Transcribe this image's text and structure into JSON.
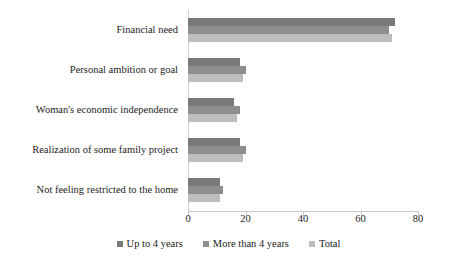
{
  "chart_data": {
    "type": "bar",
    "orientation": "horizontal",
    "title": "",
    "xlabel": "",
    "ylabel": "",
    "xlim": [
      0,
      80
    ],
    "xticks": [
      0,
      20,
      40,
      60,
      80
    ],
    "grid": false,
    "legend_position": "bottom",
    "categories": [
      "Financial need",
      "Personal ambition or goal",
      "Woman's economic independence",
      "Realization of some family project",
      "Not feeling restricted to the home"
    ],
    "series": [
      {
        "name": "Up to 4 years",
        "color": "#7a7a7a",
        "values": [
          72,
          18,
          16,
          18,
          11
        ]
      },
      {
        "name": "More than 4 years",
        "color": "#8e8e8e",
        "values": [
          70,
          20,
          18,
          20,
          12
        ]
      },
      {
        "name": "Total",
        "color": "#bdbdbd",
        "values": [
          71,
          19,
          17,
          19,
          11
        ]
      }
    ]
  }
}
